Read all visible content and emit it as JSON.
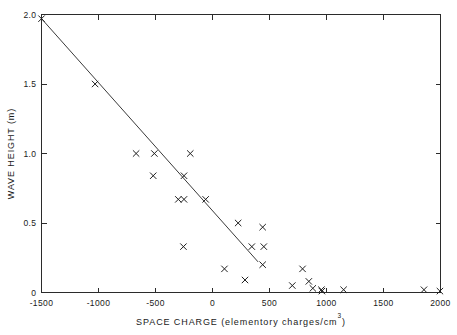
{
  "chart_data": {
    "type": "scatter",
    "title": "",
    "xlabel": "SPACE CHARGE (elementory charges/cm",
    "xlabel_exponent": "3",
    "xlabel_suffix": ")",
    "ylabel": "WAVE HEIGHT (m)",
    "xlim": [
      -1500,
      2000
    ],
    "ylim": [
      0,
      2.0
    ],
    "xticks": [
      -1500,
      -1000,
      -500,
      0,
      500,
      1000,
      1500,
      2000
    ],
    "xticklabels": [
      "-1500",
      "-1000",
      "-500",
      "0",
      "500",
      "1000",
      "1500",
      "2000"
    ],
    "yticks": [
      0,
      0.5,
      1.0,
      1.5,
      2.0
    ],
    "yticklabels": [
      "0",
      "0.5",
      "1.0",
      "1.5",
      "2.0"
    ],
    "grid": false,
    "legend": null,
    "marker_style": "x",
    "points": [
      {
        "x": -1500,
        "y": 1.97
      },
      {
        "x": -1030,
        "y": 1.5
      },
      {
        "x": -670,
        "y": 1.0
      },
      {
        "x": -510,
        "y": 1.0
      },
      {
        "x": -195,
        "y": 1.0
      },
      {
        "x": -520,
        "y": 0.84
      },
      {
        "x": -250,
        "y": 0.84
      },
      {
        "x": -300,
        "y": 0.67
      },
      {
        "x": -250,
        "y": 0.67
      },
      {
        "x": -60,
        "y": 0.67
      },
      {
        "x": 225,
        "y": 0.5
      },
      {
        "x": 440,
        "y": 0.47
      },
      {
        "x": -255,
        "y": 0.33
      },
      {
        "x": 345,
        "y": 0.33
      },
      {
        "x": 450,
        "y": 0.33
      },
      {
        "x": 105,
        "y": 0.17
      },
      {
        "x": 440,
        "y": 0.2
      },
      {
        "x": 790,
        "y": 0.17
      },
      {
        "x": 285,
        "y": 0.09
      },
      {
        "x": 845,
        "y": 0.08
      },
      {
        "x": 700,
        "y": 0.05
      },
      {
        "x": 880,
        "y": 0.03
      },
      {
        "x": 955,
        "y": 0.02
      },
      {
        "x": 960,
        "y": 0.01
      },
      {
        "x": 1150,
        "y": 0.02
      },
      {
        "x": 1855,
        "y": 0.02
      },
      {
        "x": 1995,
        "y": 0.01
      }
    ],
    "fit_line": {
      "label": "linear fit",
      "x_start": -1500,
      "y_start": 1.97,
      "x_end": 400,
      "y_end": 0.22
    },
    "colors": {
      "axis": "#2b2b2b",
      "marker": "#1f1f1f",
      "fit_line": "#3a3a3a",
      "background": "#ffffff"
    }
  }
}
